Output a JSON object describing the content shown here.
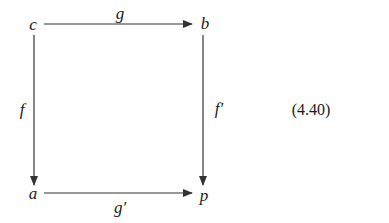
{
  "diagram": {
    "type": "commutative-square",
    "nodes": {
      "top_left": {
        "label": "c",
        "x": 33,
        "y": 24
      },
      "top_right": {
        "label": "b",
        "x": 204,
        "y": 24
      },
      "bottom_left": {
        "label": "a",
        "x": 33,
        "y": 193
      },
      "bottom_right": {
        "label": "p",
        "x": 204,
        "y": 194
      }
    },
    "arrows": [
      {
        "id": "g",
        "from": "c",
        "to": "b",
        "label": "g"
      },
      {
        "id": "f",
        "from": "c",
        "to": "a",
        "label": "f"
      },
      {
        "id": "f_prime",
        "from": "b",
        "to": "p",
        "label": "f′"
      },
      {
        "id": "g_prime",
        "from": "a",
        "to": "p",
        "label": "g′"
      }
    ],
    "equation_number": "(4.40)",
    "line_color": "#333333"
  }
}
